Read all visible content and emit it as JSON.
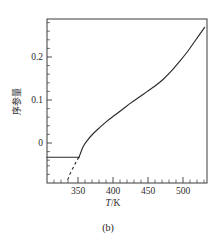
{
  "figure": {
    "caption": "(b)"
  },
  "chart_data": {
    "type": "line",
    "title": "",
    "subtitle": "",
    "xlabel": "T/K",
    "xlabel_symbol": "T",
    "xlabel_separator": "/",
    "xlabel_unit": "K",
    "ylabel": "序参量",
    "xlim": [
      325,
      525
    ],
    "ylim": [
      -0.055,
      0.295
    ],
    "xticks": [
      350,
      400,
      450,
      500
    ],
    "xticklabels": [
      "350",
      "400",
      "450",
      "500"
    ],
    "yticks": [
      0,
      0.1,
      0.2
    ],
    "yticklabels": [
      "0",
      "0.1",
      "0.2"
    ],
    "x_minor_tick_step": 10,
    "y_minor_tick_step": 0.02,
    "grid": false,
    "legend": false,
    "branch_point": {
      "x": 365,
      "y": 0.0
    },
    "series": [
      {
        "name": "trivial-branch",
        "style": "solid",
        "points": [
          {
            "x": 325,
            "y": 0.0
          },
          {
            "x": 340,
            "y": 0.0
          },
          {
            "x": 350,
            "y": 0.0
          },
          {
            "x": 358,
            "y": 0.0
          },
          {
            "x": 365,
            "y": 0.0
          }
        ]
      },
      {
        "name": "stable-branch",
        "style": "solid",
        "points": [
          {
            "x": 365,
            "y": 0.0
          },
          {
            "x": 370,
            "y": 0.022
          },
          {
            "x": 375,
            "y": 0.035
          },
          {
            "x": 382,
            "y": 0.049
          },
          {
            "x": 390,
            "y": 0.062
          },
          {
            "x": 400,
            "y": 0.077
          },
          {
            "x": 410,
            "y": 0.09
          },
          {
            "x": 420,
            "y": 0.103
          },
          {
            "x": 430,
            "y": 0.116
          },
          {
            "x": 440,
            "y": 0.128
          },
          {
            "x": 450,
            "y": 0.14
          },
          {
            "x": 460,
            "y": 0.152
          },
          {
            "x": 470,
            "y": 0.166
          },
          {
            "x": 480,
            "y": 0.183
          },
          {
            "x": 490,
            "y": 0.203
          },
          {
            "x": 500,
            "y": 0.224
          },
          {
            "x": 510,
            "y": 0.248
          },
          {
            "x": 522,
            "y": 0.277
          }
        ]
      },
      {
        "name": "unstable-branch",
        "style": "dashed",
        "points": [
          {
            "x": 365,
            "y": 0.0
          },
          {
            "x": 362,
            "y": -0.008
          },
          {
            "x": 359,
            "y": -0.018
          },
          {
            "x": 355,
            "y": -0.031
          },
          {
            "x": 352,
            "y": -0.043
          },
          {
            "x": 350,
            "y": -0.053
          }
        ]
      }
    ]
  }
}
